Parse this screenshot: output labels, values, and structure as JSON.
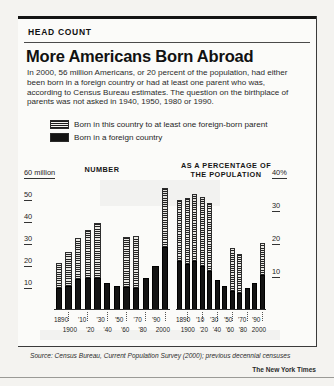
{
  "kicker": "HEAD COUNT",
  "headline": "More Americans Born Abroad",
  "deck": "In 2000, 56 million Americans, or 20 percent of the population, had either been born in a foreign country or had at least one parent who was, according to Census Bureau estimates. The question on the birthplace of parents was not asked in 1940, 1950, 1980 or 1990.",
  "legend": [
    {
      "swatch": "hatched-swatch",
      "label": "Born in this country to at least one foreign-born parent"
    },
    {
      "swatch": "solid-swatch",
      "label": "Born in a foreign country"
    }
  ],
  "source": "Source: Census Bureau, Current Population Survey (2000); previous decennial censuses",
  "credit": "The New York Times",
  "chart_data": [
    {
      "type": "bar",
      "title": "NUMBER",
      "subtype": "stacked",
      "xlabel": "",
      "ylabel": "60 million",
      "ylim": [
        0,
        60
      ],
      "yticks": [
        "60 million",
        "50",
        "40",
        "30",
        "20",
        "10"
      ],
      "ytick_values": [
        60,
        50,
        40,
        30,
        20,
        10
      ],
      "grid": false,
      "categories": [
        "1890",
        "1900",
        "'10",
        "'20",
        "'30",
        "'40",
        "'50",
        "'60",
        "'70",
        "'80",
        "'90",
        "2000"
      ],
      "series": [
        {
          "name": "Born in a foreign country",
          "values": [
            9.2,
            10.3,
            13.5,
            13.9,
            14.2,
            11.6,
            10.3,
            9.7,
            9.6,
            14.1,
            19.8,
            28.4
          ]
        },
        {
          "name": "Born in this country to at least one foreign-born parent",
          "values": [
            11.5,
            15.6,
            18.9,
            22.2,
            25.4,
            0,
            0,
            23.3,
            23.8,
            0,
            0,
            27.6
          ]
        }
      ],
      "totals": [
        20.7,
        25.9,
        32.4,
        36.1,
        39.6,
        11.6,
        10.3,
        33.0,
        33.4,
        14.1,
        19.8,
        56.0
      ],
      "note": "Light hatched upper segment missing for 1940, 1950, 1980 and 1990 (question not asked)"
    },
    {
      "type": "bar",
      "title": "AS A PERCENTAGE OF THE POPULATION",
      "subtype": "stacked",
      "xlabel": "",
      "ylabel": "40%",
      "ylim": [
        0,
        40
      ],
      "yticks": [
        "40%",
        "30",
        "20",
        "10"
      ],
      "ytick_values": [
        40,
        30,
        20,
        10
      ],
      "grid": false,
      "categories": [
        "1890",
        "1900",
        "'10",
        "'20",
        "'30",
        "'40",
        "'50",
        "'60",
        "'70",
        "'80",
        "'90",
        "2000"
      ],
      "series": [
        {
          "name": "Born in a foreign country",
          "values": [
            14.8,
            13.6,
            14.7,
            13.2,
            11.6,
            8.8,
            6.9,
            5.4,
            4.7,
            6.2,
            7.9,
            10.4
          ]
        },
        {
          "name": "Born in this country to at least one foreign-born parent",
          "values": [
            18.6,
            20.6,
            20.6,
            21.1,
            20.9,
            0,
            0,
            13.0,
            11.8,
            0,
            0,
            9.6
          ]
        }
      ],
      "totals": [
        33.4,
        34.2,
        35.3,
        34.3,
        32.5,
        8.8,
        6.9,
        18.4,
        16.5,
        6.2,
        7.9,
        20.0
      ],
      "note": "Light hatched upper segment missing for 1940, 1950, 1980 and 1990 (question not asked)"
    }
  ]
}
